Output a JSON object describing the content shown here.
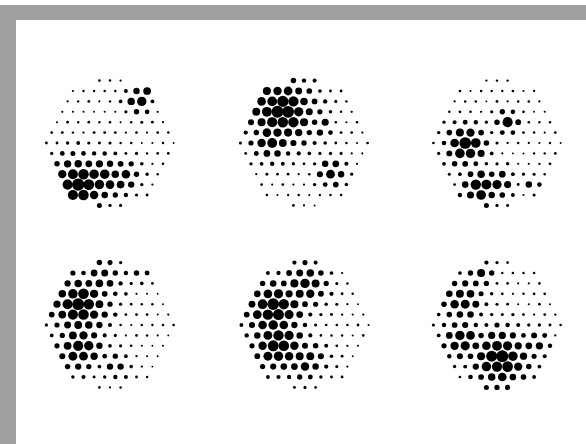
{
  "frame": {
    "border_color": "#a0a0a0",
    "background": "#ffffff",
    "dot_color": "#000000"
  },
  "grid": {
    "row_spacing": 10.4,
    "col_spacing": 10.6,
    "base_radius": 0.9,
    "max_radius": 5.6
  },
  "circles": [
    {
      "name": "halftone-circle-1",
      "cx": 110,
      "cy": 143,
      "r": 64,
      "blobs": [
        {
          "x": 78,
          "y": 184,
          "s": 20,
          "a": 1.0
        },
        {
          "x": 100,
          "y": 178,
          "s": 16,
          "a": 0.85
        },
        {
          "x": 122,
          "y": 176,
          "s": 12,
          "a": 0.7
        },
        {
          "x": 138,
          "y": 100,
          "s": 9,
          "a": 0.8
        },
        {
          "x": 145,
          "y": 92,
          "s": 6,
          "a": 0.6
        }
      ]
    },
    {
      "name": "halftone-circle-2",
      "cx": 304,
      "cy": 143,
      "r": 64,
      "blobs": [
        {
          "x": 282,
          "y": 112,
          "s": 24,
          "a": 1.0
        },
        {
          "x": 272,
          "y": 140,
          "s": 14,
          "a": 0.8
        },
        {
          "x": 322,
          "y": 126,
          "s": 7,
          "a": 0.7
        },
        {
          "x": 332,
          "y": 172,
          "s": 10,
          "a": 0.75
        }
      ]
    },
    {
      "name": "halftone-circle-3",
      "cx": 497,
      "cy": 143,
      "r": 64,
      "blobs": [
        {
          "x": 466,
          "y": 145,
          "s": 14,
          "a": 1.0
        },
        {
          "x": 480,
          "y": 187,
          "s": 12,
          "a": 0.95
        },
        {
          "x": 498,
          "y": 184,
          "s": 10,
          "a": 0.75
        },
        {
          "x": 508,
          "y": 122,
          "s": 8,
          "a": 0.8
        },
        {
          "x": 532,
          "y": 184,
          "s": 6,
          "a": 0.5
        }
      ]
    },
    {
      "name": "halftone-circle-4",
      "cx": 110,
      "cy": 325,
      "r": 64,
      "blobs": [
        {
          "x": 80,
          "y": 305,
          "s": 20,
          "a": 1.0
        },
        {
          "x": 80,
          "y": 348,
          "s": 16,
          "a": 0.85
        },
        {
          "x": 100,
          "y": 280,
          "s": 16,
          "a": 0.55
        },
        {
          "x": 115,
          "y": 365,
          "s": 10,
          "a": 0.5
        },
        {
          "x": 138,
          "y": 268,
          "s": 10,
          "a": 0.45
        }
      ]
    },
    {
      "name": "halftone-circle-5",
      "cx": 305,
      "cy": 325,
      "r": 64,
      "blobs": [
        {
          "x": 275,
          "y": 310,
          "s": 20,
          "a": 1.0
        },
        {
          "x": 278,
          "y": 345,
          "s": 18,
          "a": 0.95
        },
        {
          "x": 305,
          "y": 285,
          "s": 16,
          "a": 0.75
        },
        {
          "x": 305,
          "y": 360,
          "s": 14,
          "a": 0.7
        }
      ]
    },
    {
      "name": "halftone-circle-6",
      "cx": 497,
      "cy": 325,
      "r": 64,
      "blobs": [
        {
          "x": 500,
          "y": 358,
          "s": 20,
          "a": 1.0
        },
        {
          "x": 462,
          "y": 340,
          "s": 14,
          "a": 0.8
        },
        {
          "x": 462,
          "y": 300,
          "s": 16,
          "a": 0.7
        },
        {
          "x": 480,
          "y": 275,
          "s": 10,
          "a": 0.6
        },
        {
          "x": 535,
          "y": 345,
          "s": 10,
          "a": 0.6
        }
      ]
    }
  ]
}
